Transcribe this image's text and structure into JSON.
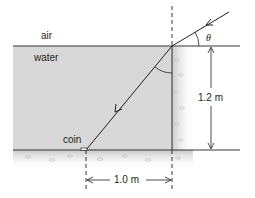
{
  "labels": {
    "air": "air",
    "water": "water",
    "coin": "coin",
    "angle": "θ",
    "depth": "1.2 m",
    "horizontal_distance": "1.0 m"
  },
  "colors": {
    "water": "#d8d8d8",
    "line": "#231f20",
    "ground": "#cfcfcf",
    "wall": "#e4e4e4"
  },
  "geometry": {
    "water_surface_y": 46,
    "bottom_y": 150,
    "normal_x": 172,
    "coin_x": 86
  }
}
